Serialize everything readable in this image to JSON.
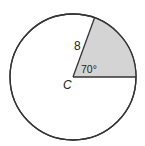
{
  "diagram": {
    "center_label": "C",
    "radius_label": "8",
    "angle_label": "70°",
    "radius": 8,
    "central_angle_deg": 70,
    "colors": {
      "stroke": "#333333",
      "shaded_sector": "#d4d4d4",
      "background": "#ffffff"
    }
  }
}
